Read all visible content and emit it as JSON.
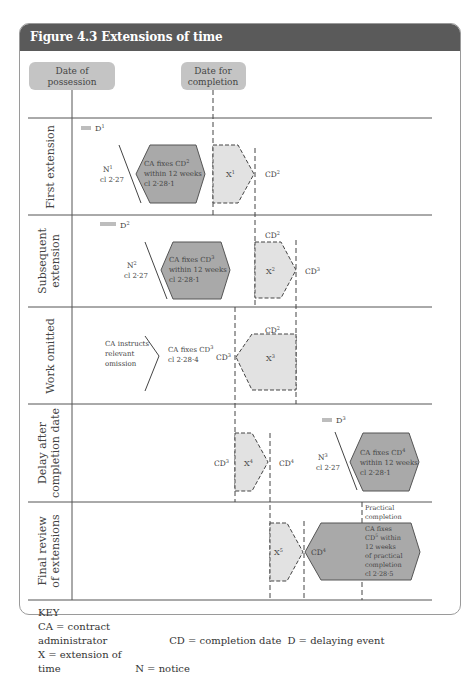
{
  "figure": {
    "title": "Figure 4.3  Extensions of time",
    "header_color": "#5a5a5a"
  },
  "milestones": {
    "possession": [
      "Date of",
      "possession"
    ],
    "completion": [
      "Date for",
      "completion"
    ]
  },
  "rows": [
    {
      "label": [
        "First extension"
      ],
      "delay": "D",
      "delay_sup": "1",
      "notice": "N",
      "notice_sup": "1",
      "notice_clause": "cl 2·27",
      "ca_box": [
        "CA fixes CD",
        "within 12 weeks",
        "cl 2·28·1"
      ],
      "ca_sup": "2",
      "extension": "X",
      "extension_sup": "1",
      "cd_right": "CD",
      "cd_right_sup": "2"
    },
    {
      "label": [
        "Subsequent",
        "extension"
      ],
      "delay": "D",
      "delay_sup": "2",
      "notice": "N",
      "notice_sup": "2",
      "notice_clause": "cl 2·27",
      "ca_box": [
        "CA fixes CD",
        "within 12 weeks",
        "cl 2·28·1"
      ],
      "ca_sup": "3",
      "cd_top": "CD",
      "cd_top_sup": "2",
      "extension": "X",
      "extension_sup": "2",
      "cd_right": "CD",
      "cd_right_sup": "3"
    },
    {
      "label": [
        "Work omitted"
      ],
      "instruction": [
        "CA instructs",
        "relevant",
        "omission"
      ],
      "ca_fix": [
        "CA fixes CD",
        "cl 2·28·4"
      ],
      "ca_sup": "3",
      "cd_left": "CD",
      "cd_left_sup": "3",
      "cd_top": "CD",
      "cd_top_sup": "2",
      "extension": "X",
      "extension_sup": "3"
    },
    {
      "label": [
        "Delay after",
        "completion date"
      ],
      "cd_left": "CD",
      "cd_left_sup": "3",
      "extension": "X",
      "extension_sup": "4",
      "cd_right": "CD",
      "cd_right_sup": "4",
      "delay": "D",
      "delay_sup": "3",
      "notice": "N",
      "notice_sup": "3",
      "notice_clause": "cl 2·27",
      "ca_box": [
        "CA fixes CD",
        "within 12 weeks",
        "cl 2·28·1"
      ],
      "ca_sup": "4"
    },
    {
      "label": [
        "Final review",
        "of extensions"
      ],
      "extension": "X",
      "extension_sup": "5",
      "cd_mid": "CD",
      "cd_mid_sup": "4",
      "practical": [
        "Practical",
        "completion"
      ],
      "ca_box": [
        "CA fixes",
        "CD",
        " within",
        "12 weeks",
        "of practical",
        "completion",
        "cl 2·28·5"
      ],
      "ca_sup": "5"
    }
  ],
  "key": {
    "title": "KEY",
    "items": [
      [
        "CA = contract administrator",
        "CD = completion date",
        "D = delaying event"
      ],
      [
        "X = extension of time",
        "N = notice"
      ]
    ]
  },
  "colors": {
    "ca_fill": "#a9a9a9",
    "ext_fill": "#e2e2e2",
    "pill_fill": "#c4c4c4",
    "delay_bar": "#bdbdbd"
  }
}
